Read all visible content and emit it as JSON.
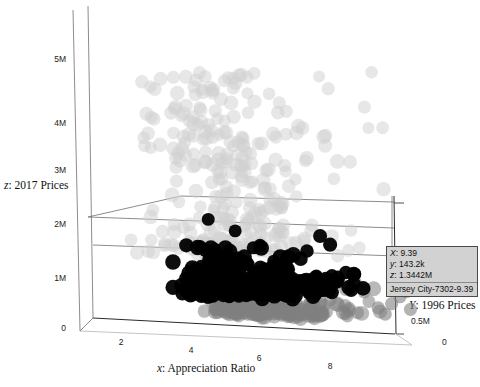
{
  "chart_data": {
    "type": "scatter",
    "projection": "3d",
    "title": "",
    "xlabel": "x: Appreciation Ratio",
    "ylabel": "Y: 1996 Prices",
    "zlabel": "z: 2017 Prices",
    "xticks": [
      "2",
      "4",
      "6",
      "8"
    ],
    "xtick_values": [
      2,
      4,
      6,
      8
    ],
    "yticks": [
      "0",
      "0.5M",
      "1M"
    ],
    "ytick_values": [
      0,
      500000,
      1000000
    ],
    "zticks": [
      "0",
      "1M",
      "2M",
      "3M",
      "4M",
      "5M"
    ],
    "ztick_values": [
      0,
      1000000,
      2000000,
      3000000,
      4000000,
      5000000
    ],
    "xlim": [
      0,
      9.8
    ],
    "ylim": [
      0,
      1400000
    ],
    "zlim": [
      0,
      5600000
    ],
    "grid": false,
    "legend": "none",
    "series": [
      {
        "name": "low-cluster",
        "color": "#808080",
        "marker": "o",
        "alpha": 0.55,
        "n_points": 260,
        "description": "Medium gray dense band at low z, front depth plane"
      },
      {
        "name": "mid-cluster",
        "color": "#000000",
        "marker": "o",
        "alpha": 0.95,
        "n_points": 300,
        "description": "Black dense core band around z 0.8M-1.6M"
      },
      {
        "name": "high-cluster",
        "color": "#d0d0d0",
        "marker": "o",
        "alpha": 0.5,
        "n_points": 240,
        "description": "Light gray sparse plume extending up to z 5M"
      }
    ],
    "highlighted_point": {
      "x": 9.39,
      "y": 143200,
      "z": 1344200,
      "label": "Jersey City-7302-9.39",
      "color": "#000000"
    }
  },
  "axes": {
    "x": {
      "title_prefix": "x",
      "title_suffix": ": Appreciation Ratio",
      "full_title": "x: Appreciation Ratio",
      "ticks": [
        "2",
        "4",
        "6",
        "8"
      ]
    },
    "y": {
      "title_prefix": "Y",
      "title_suffix": ": 1996 Prices",
      "full_title": "Y: 1996 Prices",
      "ticks": [
        "0",
        "0.5M",
        "1M"
      ]
    },
    "z": {
      "title_prefix": "z",
      "title_suffix": ": 2017 Prices",
      "full_title": "z: 2017 Prices",
      "ticks": [
        "0",
        "1M",
        "2M",
        "3M",
        "4M",
        "5M"
      ]
    }
  },
  "tooltip": {
    "x_key": "X",
    "x_value": "9.39",
    "y_key": "y",
    "y_value": "143.2k",
    "z_key": "z",
    "z_value": "1.3442M",
    "name": "Jersey City-7302-9.39",
    "bg_color": "#d2d2d2",
    "border_color": "#4a4a4a"
  },
  "colors": {
    "background": "#ffffff",
    "frame": "#6f6f6f",
    "frame_dark": "#2a2a2a",
    "frame_light": "#b5b5b5",
    "text": "#111111",
    "point_light": "#d0d0d0",
    "point_mid": "#000000",
    "point_dark_gray": "#808080"
  }
}
